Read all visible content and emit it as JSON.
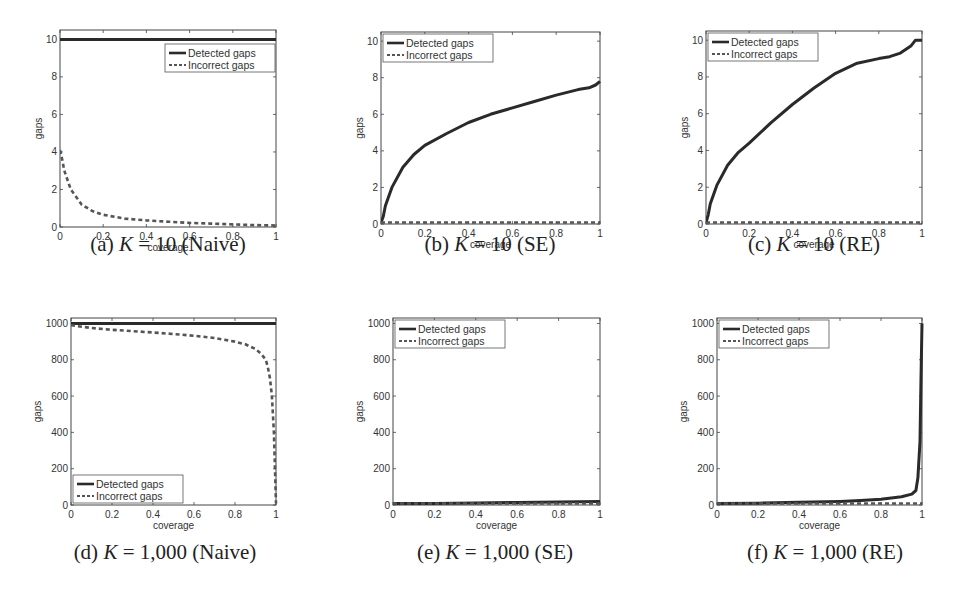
{
  "figure": {
    "panels": [
      {
        "id": "a",
        "caption_prefix": "(a) ",
        "caption_k": "K",
        "caption_rest": " = 10 (Naive)"
      },
      {
        "id": "b",
        "caption_prefix": "(b) ",
        "caption_k": "K",
        "caption_rest": " = 10 (SE)"
      },
      {
        "id": "c",
        "caption_prefix": "(c) ",
        "caption_k": "K",
        "caption_rest": " = 10 (RE)"
      },
      {
        "id": "d",
        "caption_prefix": "(d) ",
        "caption_k": "K",
        "caption_rest": " = 1,000 (Naive)"
      },
      {
        "id": "e",
        "caption_prefix": "(e) ",
        "caption_k": "K",
        "caption_rest": " = 1,000 (SE)"
      },
      {
        "id": "f",
        "caption_prefix": "(f) ",
        "caption_k": "K",
        "caption_rest": " = 1,000 (RE)"
      }
    ]
  },
  "chart_data": [
    {
      "type": "line",
      "title": "(a) K = 10 (Naive)",
      "xlabel": "coverage",
      "ylabel": "gaps",
      "xlim": [
        0,
        1
      ],
      "ylim": [
        0,
        10.5
      ],
      "xticks": [
        "0",
        "0.2",
        "0.4",
        "0.6",
        "0.8",
        "1"
      ],
      "yticks": [
        "0",
        "2",
        "4",
        "6",
        "8",
        "10"
      ],
      "legend": [
        "Detected gaps",
        "Incorrect gaps"
      ],
      "legend_position": "upper right",
      "grid": false,
      "x": [
        0,
        0.01,
        0.02,
        0.05,
        0.1,
        0.15,
        0.2,
        0.3,
        0.4,
        0.5,
        0.6,
        0.7,
        0.8,
        0.9,
        1.0
      ],
      "series": [
        {
          "name": "Detected gaps",
          "style": "solid",
          "values": [
            10,
            10,
            10,
            10,
            10,
            10,
            10,
            10,
            10,
            10,
            10,
            10,
            10,
            10,
            10
          ]
        },
        {
          "name": "Incorrect gaps",
          "style": "dashed",
          "values": [
            4.1,
            3.6,
            3.0,
            2.0,
            1.2,
            0.85,
            0.65,
            0.45,
            0.35,
            0.28,
            0.22,
            0.18,
            0.14,
            0.1,
            0.08
          ]
        }
      ]
    },
    {
      "type": "line",
      "title": "(b) K = 10 (SE)",
      "xlabel": "coverage",
      "ylabel": "gaps",
      "xlim": [
        0,
        1
      ],
      "ylim": [
        0,
        10.5
      ],
      "xticks": [
        "0",
        "0.2",
        "0.4",
        "0.6",
        "0.8",
        "1"
      ],
      "yticks": [
        "0",
        "2",
        "4",
        "6",
        "8",
        "10"
      ],
      "legend": [
        "Detected gaps",
        "Incorrect gaps"
      ],
      "legend_position": "upper left",
      "grid": false,
      "x": [
        0,
        0.01,
        0.02,
        0.05,
        0.1,
        0.15,
        0.2,
        0.3,
        0.4,
        0.5,
        0.6,
        0.7,
        0.8,
        0.9,
        0.95,
        0.98,
        1.0
      ],
      "series": [
        {
          "name": "Detected gaps",
          "style": "solid",
          "values": [
            0,
            0.4,
            1.0,
            2.0,
            3.1,
            3.8,
            4.3,
            4.95,
            5.55,
            6.0,
            6.35,
            6.7,
            7.05,
            7.35,
            7.45,
            7.6,
            7.8
          ]
        },
        {
          "name": "Incorrect gaps",
          "style": "dashed",
          "values": [
            0,
            0,
            0,
            0,
            0,
            0,
            0,
            0,
            0,
            0,
            0,
            0,
            0,
            0,
            0,
            0,
            0
          ]
        }
      ]
    },
    {
      "type": "line",
      "title": "(c) K = 10 (RE)",
      "xlabel": "coverage",
      "ylabel": "gaps",
      "xlim": [
        0,
        1
      ],
      "ylim": [
        0,
        10.5
      ],
      "xticks": [
        "0",
        "0.2",
        "0.4",
        "0.6",
        "0.8",
        "1"
      ],
      "yticks": [
        "0",
        "2",
        "4",
        "6",
        "8",
        "10"
      ],
      "legend": [
        "Detected gaps",
        "Incorrect gaps"
      ],
      "legend_position": "upper left",
      "grid": false,
      "x": [
        0,
        0.01,
        0.02,
        0.05,
        0.1,
        0.15,
        0.2,
        0.3,
        0.4,
        0.5,
        0.6,
        0.7,
        0.8,
        0.85,
        0.9,
        0.95,
        0.97,
        1.0
      ],
      "series": [
        {
          "name": "Detected gaps",
          "style": "solid",
          "values": [
            0,
            0.5,
            1.1,
            2.1,
            3.2,
            3.9,
            4.4,
            5.5,
            6.5,
            7.4,
            8.2,
            8.75,
            9.0,
            9.1,
            9.3,
            9.7,
            10.0,
            10.0
          ]
        },
        {
          "name": "Incorrect gaps",
          "style": "dashed",
          "values": [
            0,
            0,
            0,
            0,
            0,
            0,
            0,
            0,
            0,
            0,
            0,
            0,
            0,
            0,
            0,
            0,
            0,
            0
          ]
        }
      ]
    },
    {
      "type": "line",
      "title": "(d) K = 1,000 (Naive)",
      "xlabel": "coverage",
      "ylabel": "gaps",
      "xlim": [
        0,
        1
      ],
      "ylim": [
        0,
        1030
      ],
      "xticks": [
        "0",
        "0.2",
        "0.4",
        "0.6",
        "0.8",
        "1"
      ],
      "yticks": [
        "0",
        "200",
        "400",
        "600",
        "800",
        "1000"
      ],
      "legend": [
        "Detected gaps",
        "Incorrect gaps"
      ],
      "legend_position": "lower left",
      "grid": false,
      "x": [
        0,
        0.1,
        0.2,
        0.3,
        0.4,
        0.5,
        0.6,
        0.7,
        0.8,
        0.85,
        0.9,
        0.93,
        0.95,
        0.96,
        0.97,
        0.98,
        0.99,
        1.0
      ],
      "series": [
        {
          "name": "Detected gaps",
          "style": "solid",
          "values": [
            1000,
            1000,
            1000,
            1000,
            1000,
            1000,
            1000,
            1000,
            1000,
            1000,
            1000,
            1000,
            1000,
            1000,
            1000,
            1000,
            1000,
            1000
          ]
        },
        {
          "name": "Incorrect gaps",
          "style": "dashed",
          "values": [
            990,
            975,
            965,
            958,
            950,
            942,
            932,
            920,
            900,
            885,
            860,
            830,
            800,
            760,
            700,
            600,
            400,
            0
          ]
        }
      ]
    },
    {
      "type": "line",
      "title": "(e) K = 1,000 (SE)",
      "xlabel": "coverage",
      "ylabel": "gaps",
      "xlim": [
        0,
        1
      ],
      "ylim": [
        0,
        1030
      ],
      "xticks": [
        "0",
        "0.2",
        "0.4",
        "0.6",
        "0.8",
        "1"
      ],
      "yticks": [
        "0",
        "200",
        "400",
        "600",
        "800",
        "1000"
      ],
      "legend": [
        "Detected gaps",
        "Incorrect gaps"
      ],
      "legend_position": "upper left",
      "grid": false,
      "x": [
        0,
        0.2,
        0.4,
        0.6,
        0.8,
        1.0
      ],
      "series": [
        {
          "name": "Detected gaps",
          "style": "solid",
          "values": [
            5,
            8,
            11,
            14,
            16,
            20
          ]
        },
        {
          "name": "Incorrect gaps",
          "style": "dashed",
          "values": [
            0,
            0,
            0,
            0,
            0,
            0
          ]
        }
      ]
    },
    {
      "type": "line",
      "title": "(f) K = 1,000 (RE)",
      "xlabel": "coverage",
      "ylabel": "gaps",
      "xlim": [
        0,
        1
      ],
      "ylim": [
        0,
        1030
      ],
      "xticks": [
        "0",
        "0.2",
        "0.4",
        "0.6",
        "0.8",
        "1"
      ],
      "yticks": [
        "0",
        "200",
        "400",
        "600",
        "800",
        "1000"
      ],
      "legend": [
        "Detected gaps",
        "Incorrect gaps"
      ],
      "legend_position": "upper left",
      "grid": false,
      "x": [
        0,
        0.2,
        0.4,
        0.6,
        0.7,
        0.8,
        0.9,
        0.95,
        0.97,
        0.98,
        0.99,
        0.995,
        1.0
      ],
      "series": [
        {
          "name": "Detected gaps",
          "style": "solid",
          "values": [
            5,
            10,
            15,
            20,
            25,
            32,
            45,
            60,
            80,
            150,
            350,
            700,
            1000
          ]
        },
        {
          "name": "Incorrect gaps",
          "style": "dashed",
          "values": [
            0,
            0,
            0,
            0,
            0,
            0,
            0,
            0,
            0,
            0,
            0,
            0,
            0
          ]
        }
      ]
    }
  ]
}
